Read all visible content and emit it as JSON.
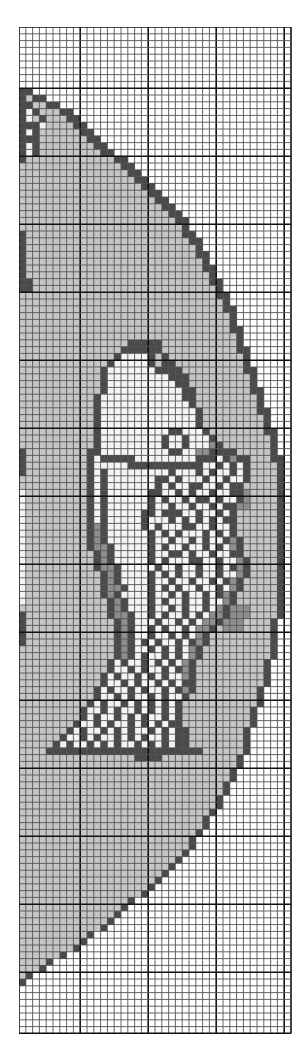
{
  "chart": {
    "title": "",
    "type": "cross-stitch-pattern",
    "cols": 40,
    "rows": 148,
    "cell_px": 6.8,
    "major_every": 10,
    "major_offset_col": 9,
    "major_offset_row": 9,
    "palette": {
      ".": "#ffffff",
      "g": "#c6c6c6",
      "m": "#8e8e8e",
      "d": "#4a4a4a",
      "w": "#f4f4f4",
      "l": "#e0e0e0"
    },
    "grid_color_minor": "#555555",
    "grid_color_major": "#111111",
    "circle_edge_by_row": [
      [
        9,
        1
      ],
      [
        10,
        3
      ],
      [
        11,
        5
      ],
      [
        12,
        7
      ],
      [
        13,
        8
      ],
      [
        14,
        9
      ],
      [
        15,
        10
      ],
      [
        16,
        11
      ],
      [
        17,
        12
      ],
      [
        18,
        13
      ],
      [
        19,
        15
      ],
      [
        20,
        16
      ],
      [
        21,
        17
      ],
      [
        22,
        18
      ],
      [
        23,
        19
      ],
      [
        24,
        20
      ],
      [
        25,
        21
      ],
      [
        26,
        22
      ],
      [
        27,
        23
      ],
      [
        28,
        24
      ],
      [
        29,
        24
      ],
      [
        30,
        25
      ],
      [
        31,
        26
      ],
      [
        32,
        26
      ],
      [
        33,
        27
      ],
      [
        34,
        27
      ],
      [
        35,
        28
      ],
      [
        36,
        28
      ],
      [
        37,
        29
      ],
      [
        38,
        29
      ],
      [
        39,
        30
      ],
      [
        40,
        30
      ],
      [
        41,
        31
      ],
      [
        42,
        31
      ],
      [
        43,
        31
      ],
      [
        44,
        32
      ],
      [
        45,
        32
      ],
      [
        46,
        32
      ],
      [
        47,
        33
      ],
      [
        48,
        33
      ],
      [
        49,
        33
      ],
      [
        50,
        34
      ],
      [
        51,
        34
      ],
      [
        52,
        34
      ],
      [
        53,
        35
      ],
      [
        54,
        35
      ],
      [
        55,
        35
      ],
      [
        56,
        36
      ],
      [
        57,
        36
      ],
      [
        58,
        36
      ],
      [
        59,
        37
      ],
      [
        60,
        37
      ],
      [
        61,
        37
      ],
      [
        62,
        37
      ],
      [
        63,
        38
      ],
      [
        64,
        38
      ],
      [
        65,
        38
      ],
      [
        66,
        38
      ],
      [
        67,
        38
      ],
      [
        68,
        38
      ],
      [
        69,
        38
      ],
      [
        70,
        38
      ],
      [
        71,
        38
      ],
      [
        72,
        38
      ],
      [
        73,
        38
      ],
      [
        74,
        38
      ],
      [
        75,
        38
      ],
      [
        76,
        38
      ],
      [
        77,
        38
      ],
      [
        78,
        38
      ],
      [
        79,
        38
      ],
      [
        80,
        38
      ],
      [
        81,
        38
      ],
      [
        82,
        38
      ],
      [
        83,
        38
      ],
      [
        84,
        38
      ],
      [
        85,
        38
      ],
      [
        86,
        38
      ],
      [
        87,
        37
      ],
      [
        88,
        37
      ],
      [
        89,
        37
      ],
      [
        90,
        37
      ],
      [
        91,
        37
      ],
      [
        92,
        37
      ],
      [
        93,
        36
      ],
      [
        94,
        36
      ],
      [
        95,
        36
      ],
      [
        96,
        36
      ],
      [
        97,
        35
      ],
      [
        98,
        35
      ],
      [
        99,
        35
      ],
      [
        100,
        34
      ],
      [
        101,
        34
      ],
      [
        102,
        34
      ],
      [
        103,
        33
      ],
      [
        104,
        33
      ],
      [
        105,
        33
      ],
      [
        106,
        33
      ],
      [
        107,
        32
      ],
      [
        108,
        32
      ],
      [
        109,
        31
      ],
      [
        110,
        31
      ],
      [
        111,
        30
      ],
      [
        112,
        30
      ],
      [
        113,
        29
      ],
      [
        114,
        29
      ],
      [
        115,
        28
      ],
      [
        116,
        27
      ],
      [
        117,
        27
      ],
      [
        118,
        26
      ],
      [
        119,
        25
      ],
      [
        120,
        25
      ],
      [
        121,
        24
      ],
      [
        122,
        23
      ],
      [
        123,
        22
      ],
      [
        124,
        21
      ],
      [
        125,
        20
      ],
      [
        126,
        19
      ],
      [
        127,
        18
      ],
      [
        128,
        16
      ],
      [
        129,
        15
      ],
      [
        130,
        14
      ],
      [
        131,
        13
      ],
      [
        132,
        12
      ],
      [
        133,
        10
      ],
      [
        134,
        9
      ],
      [
        135,
        8
      ],
      [
        136,
        6
      ],
      [
        137,
        4
      ],
      [
        138,
        3
      ],
      [
        139,
        1
      ],
      [
        140,
        0
      ]
    ],
    "fish_rows": [
      [
        47,
        15,
        21,
        "dddddd"
      ],
      [
        48,
        14,
        22,
        "dwwwwdgd"
      ],
      [
        49,
        13,
        23,
        "dwwwwwdgdd"
      ],
      [
        50,
        12,
        24,
        "dwwwwwwwdddd"
      ],
      [
        51,
        12,
        25,
        "dwwwwwwwwwddd"
      ],
      [
        52,
        12,
        25,
        "dwwwwwwwwwwdd"
      ],
      [
        53,
        12,
        26,
        "dwwwwwwwwwwwdd"
      ],
      [
        54,
        11,
        26,
        "dwwwwwwwwwwwwdd"
      ],
      [
        55,
        11,
        26,
        "dwwwwwwwwwwwwwd"
      ],
      [
        56,
        11,
        27,
        "dwwwwwwwwwwwwwwd"
      ],
      [
        57,
        11,
        27,
        "dwwwwwwwwwwwwwwd"
      ],
      [
        58,
        11,
        27,
        "dwwwwwwwwwwwwwwd"
      ],
      [
        59,
        11,
        28,
        "dwwwwwwwwwwddwwwd"
      ],
      [
        60,
        11,
        28,
        "dwwwwwwwwwdwwdwwwd"
      ],
      [
        61,
        11,
        29,
        "dwwwwwwwwwdwwdwwwmd"
      ],
      [
        62,
        10,
        31,
        "ddwwwwwwwwwwddwwmmdddd"
      ],
      [
        63,
        10,
        32,
        "dwdddddwwwwwwwwwdddwdmdd"
      ],
      [
        64,
        10,
        32,
        "dwwwwwdddddddddddwwdwdwd"
      ],
      [
        65,
        10,
        32,
        "dwdwwwwwwwwwdwwwdwdwwdwd"
      ],
      [
        66,
        10,
        32,
        "dwdwwwwwwwddwdwwwdwwdwwd"
      ],
      [
        67,
        10,
        31,
        "dwdwwwwwwwdwdwwddwwdwdd"
      ],
      [
        68,
        10,
        31,
        "dwdwwwwwwddwwdwdwwdwwdd"
      ],
      [
        69,
        10,
        31,
        "dwdwwwwwwdwdwwdwddwdwwd"
      ],
      [
        70,
        10,
        30,
        "dwdwwwwwwdwwdwwdwwdwdd"
      ],
      [
        71,
        10,
        30,
        "dwdwwwwwddwdddwwdwwdwd"
      ],
      [
        72,
        10,
        30,
        "dwdwwwwwdwwwdwdwdwdwdd"
      ],
      [
        73,
        10,
        30,
        "dmdwwwwwdwdwwwddwwdwwd"
      ],
      [
        74,
        10,
        30,
        "dmdwwwwwwdwdwdwwwdwdwd"
      ],
      [
        75,
        10,
        31,
        "dmdwwwwwwdwwdwwdwdwwdmd"
      ],
      [
        76,
        10,
        31,
        "dmmdwwwwwdwdwwdwwdwdwmd"
      ],
      [
        77,
        11,
        31,
        "dmdwwwwwdwwddwdwwdwwdd"
      ],
      [
        78,
        11,
        32,
        "dmdwwwwwdwdwwwddwwdwwmd"
      ],
      [
        79,
        11,
        32,
        "dmmdwwwwwdwwdwwdwwdwdmd"
      ],
      [
        80,
        12,
        32,
        "dmdwwwwdwdwdwwdwwdwwmd"
      ],
      [
        81,
        12,
        31,
        "dmdwwwwdwwdwwdwwdwdmd"
      ],
      [
        82,
        12,
        31,
        "dmmdwwwdwdwdwwdwwdwmd"
      ],
      [
        83,
        12,
        30,
        "dmdwwwwdwwdwdwwdwdmd"
      ],
      [
        84,
        13,
        30,
        "dmdwwwdwdwwdwwdwwmd"
      ],
      [
        85,
        13,
        29,
        "dmdwwwdwwdwdwwdwmd"
      ],
      [
        86,
        13,
        29,
        "dmmdwwdwdwwdwdwmmd"
      ],
      [
        87,
        14,
        28,
        "dmdwwwdwwdwdwmmd"
      ],
      [
        88,
        14,
        28,
        "dmdwwdwdwwdwmmd"
      ],
      [
        89,
        14,
        27,
        "dmdwwdwwdwdwmd"
      ],
      [
        90,
        14,
        27,
        "dmdwdwdwwdwdmd"
      ],
      [
        91,
        14,
        26,
        "dmdwwdwdwdwmd"
      ],
      [
        92,
        14,
        26,
        "dmdwdwwdwdwmd"
      ],
      [
        93,
        13,
        26,
        "dwdwwdwdwdwmd"
      ],
      [
        94,
        13,
        26,
        "dwwdwdwwdwdmd"
      ],
      [
        95,
        12,
        26,
        "dwdwwdwdwdwwmd"
      ],
      [
        96,
        12,
        26,
        "dwwdwdwwdwdwdd"
      ],
      [
        97,
        11,
        26,
        "dwdwwdwdwwdwdmd"
      ],
      [
        98,
        11,
        25,
        "dwwdwdwwdwdwwd"
      ],
      [
        99,
        10,
        25,
        "dwdwwdwdwdwdwd"
      ],
      [
        100,
        9,
        25,
        "dwwdwdwwdwdwdwd"
      ],
      [
        101,
        9,
        25,
        "dwdwwdwdwdwwdwd"
      ],
      [
        102,
        8,
        25,
        "dwwdwdwwdwdwdwdd"
      ],
      [
        103,
        7,
        26,
        "dwdwwdwdwdwwdwdwdd"
      ],
      [
        104,
        6,
        26,
        "dwwdwdwwdwdwdwwdwdd"
      ],
      [
        105,
        5,
        26,
        "dwdwwdwdwdwwdwdwdwdd"
      ],
      [
        106,
        4,
        27,
        "ddddddddddddddddddddddd"
      ],
      [
        107,
        17,
        21,
        "dddd"
      ]
    ],
    "head_edge_rows": [
      [
        46,
        16,
        20,
        "ddddd"
      ]
    ],
    "left_dark_cells": [
      [
        10,
        0
      ],
      [
        11,
        0
      ],
      [
        11,
        1
      ],
      [
        12,
        0
      ],
      [
        12,
        2
      ],
      [
        13,
        0
      ],
      [
        13,
        3
      ],
      [
        14,
        0
      ],
      [
        14,
        1
      ],
      [
        14,
        2
      ],
      [
        15,
        2
      ],
      [
        16,
        0
      ],
      [
        16,
        2
      ],
      [
        17,
        2
      ],
      [
        18,
        2
      ],
      [
        15,
        0
      ],
      [
        16,
        1
      ],
      [
        17,
        0
      ],
      [
        18,
        0
      ],
      [
        19,
        0
      ],
      [
        30,
        0
      ],
      [
        31,
        0
      ],
      [
        32,
        0
      ],
      [
        33,
        0
      ],
      [
        34,
        0
      ],
      [
        35,
        0
      ],
      [
        36,
        0
      ],
      [
        37,
        0
      ],
      [
        37,
        1
      ],
      [
        38,
        0
      ],
      [
        38,
        1
      ],
      [
        62,
        0
      ],
      [
        63,
        0
      ],
      [
        64,
        0
      ],
      [
        65,
        0
      ],
      [
        86,
        0
      ],
      [
        87,
        0
      ],
      [
        88,
        0
      ],
      [
        89,
        0
      ],
      [
        90,
        0
      ]
    ],
    "left_white_cells": [
      [
        12,
        1
      ],
      [
        13,
        1
      ],
      [
        14,
        3
      ],
      [
        15,
        1
      ],
      [
        17,
        1
      ],
      [
        18,
        1
      ],
      [
        68,
        0
      ],
      [
        69,
        0
      ],
      [
        70,
        0
      ],
      [
        71,
        0
      ],
      [
        72,
        0
      ],
      [
        73,
        0
      ],
      [
        74,
        0
      ],
      [
        75,
        0
      ],
      [
        76,
        0
      ],
      [
        77,
        0
      ],
      [
        78,
        0
      ],
      [
        79,
        0
      ],
      [
        80,
        0
      ],
      [
        81,
        0
      ],
      [
        82,
        0
      ],
      [
        83,
        0
      ],
      [
        84,
        0
      ]
    ],
    "mid_dark_band_rows": [
      [
        62,
        29,
        31
      ],
      [
        63,
        30,
        32
      ],
      [
        64,
        30,
        32
      ],
      [
        65,
        30,
        32
      ],
      [
        66,
        30,
        32
      ],
      [
        67,
        30,
        32
      ],
      [
        68,
        30,
        33
      ],
      [
        69,
        30,
        33
      ],
      [
        70,
        30,
        33
      ],
      [
        85,
        31,
        33
      ],
      [
        86,
        31,
        33
      ],
      [
        87,
        30,
        32
      ],
      [
        88,
        30,
        32
      ]
    ]
  }
}
